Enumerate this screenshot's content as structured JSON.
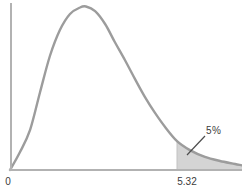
{
  "figure": {
    "x_axis": {
      "origin_label": "0",
      "critical_tick_label": "5.32"
    },
    "annotation": {
      "tail_label": "5%"
    },
    "colors": {
      "background": "#ffffff",
      "curve": "#9c9c9c",
      "axis": "#b2b2b2",
      "shade": "#d4d4d4",
      "shade_edge": "#c2c2c2",
      "leader": "#4d4d4d",
      "text": "#3c3c3c"
    }
  },
  "chart_data": {
    "type": "area",
    "title": "",
    "xlabel": "",
    "ylabel": "",
    "grid": false,
    "legend": false,
    "x_range": [
      0,
      7.39
    ],
    "y_range": [
      0,
      1.05
    ],
    "x_ticks": [
      {
        "value": 0,
        "label": "0"
      },
      {
        "value": 5.32,
        "label": "5.32"
      }
    ],
    "critical_value": 5.32,
    "shaded_region": {
      "x_from": 5.32,
      "x_to": 7.39,
      "label": "5%",
      "area_fraction": 0.05
    },
    "series": [
      {
        "name": "density-curve",
        "points": [
          [
            0.0,
            0.0
          ],
          [
            0.32,
            0.11
          ],
          [
            0.64,
            0.245
          ],
          [
            0.96,
            0.477
          ],
          [
            1.27,
            0.697
          ],
          [
            1.59,
            0.856
          ],
          [
            1.91,
            0.954
          ],
          [
            2.23,
            0.994
          ],
          [
            2.42,
            1.0
          ],
          [
            2.71,
            0.972
          ],
          [
            3.03,
            0.893
          ],
          [
            3.34,
            0.783
          ],
          [
            3.66,
            0.673
          ],
          [
            3.98,
            0.557
          ],
          [
            4.3,
            0.446
          ],
          [
            4.62,
            0.349
          ],
          [
            4.94,
            0.263
          ],
          [
            5.32,
            0.177
          ],
          [
            5.73,
            0.122
          ],
          [
            6.21,
            0.08
          ],
          [
            6.69,
            0.055
          ],
          [
            7.17,
            0.037
          ],
          [
            7.39,
            0.028
          ]
        ]
      }
    ]
  }
}
